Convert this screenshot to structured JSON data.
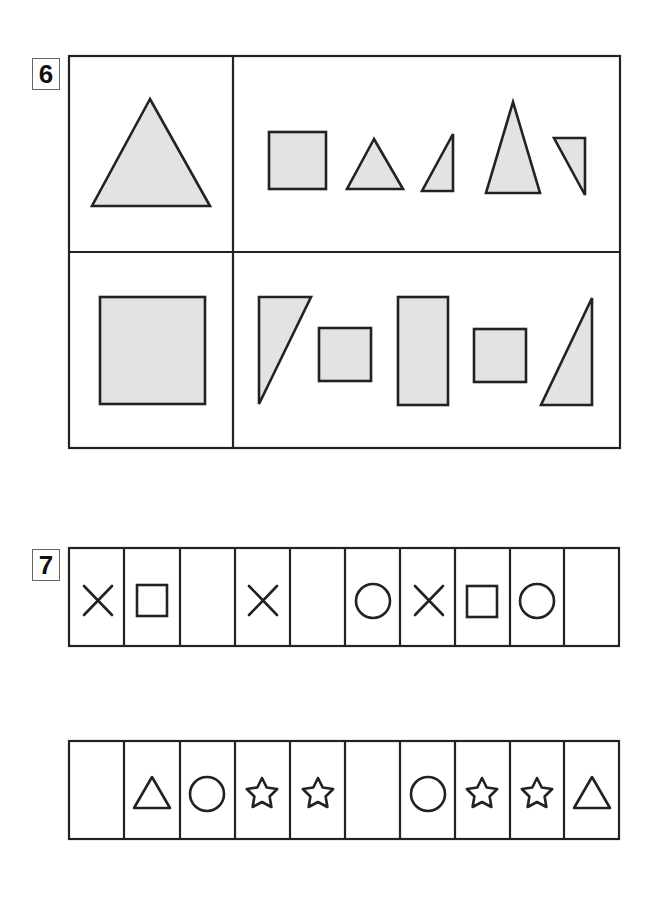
{
  "colors": {
    "stroke": "#222222",
    "fill": "#e3e3e3",
    "background": "#ffffff"
  },
  "problem6": {
    "number": "6",
    "grid": {
      "rows": 2,
      "cols": 2
    },
    "top_left": {
      "shape": "equilateral-triangle"
    },
    "top_right": {
      "shapes": [
        "square",
        "small-triangle",
        "right-triangle",
        "tall-isosceles-triangle",
        "inverted-right-triangle"
      ]
    },
    "bottom_left": {
      "shape": "square"
    },
    "bottom_right": {
      "shapes": [
        "right-triangle-tall",
        "square",
        "tall-rectangle",
        "square",
        "right-triangle"
      ]
    }
  },
  "problem7": {
    "number": "7",
    "rows": [
      {
        "cells": [
          "cross",
          "square",
          "",
          "cross",
          "",
          "circle",
          "cross",
          "square",
          "circle",
          ""
        ]
      },
      {
        "cells": [
          "",
          "triangle",
          "circle",
          "star",
          "star",
          "",
          "circle",
          "star",
          "star",
          "triangle"
        ]
      }
    ]
  }
}
